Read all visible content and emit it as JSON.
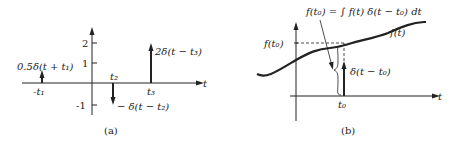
{
  "panel_a": {
    "caption": "(a)",
    "axis_label": "t",
    "y_ticks": [
      "2",
      "1",
      "-1"
    ],
    "impulses": [
      {
        "position_label": "-t₁",
        "label": "0.5δ(t + t₁)",
        "weight": 0.5
      },
      {
        "position_label": "t₂",
        "label": "− δ(t − t₂)",
        "weight": -1
      },
      {
        "position_label": "t₃",
        "label": "2δ(t − t₃)",
        "weight": 2
      }
    ]
  },
  "panel_b": {
    "caption": "(b)",
    "axis_label": "t",
    "y_label": "f(t₀)",
    "x_label": "t₀",
    "curve_label": "f(t)",
    "impulse_label": "δ(t − t₀)",
    "equation": "f(t₀) = ∫ f(t) δ(t − t₀) dt"
  }
}
